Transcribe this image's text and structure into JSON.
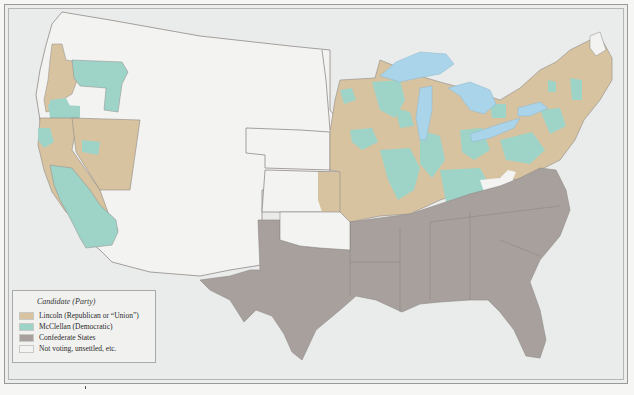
{
  "map": {
    "colors": {
      "lincoln": "#d8c3a0",
      "mcclellan": "#9ed3c8",
      "confederate": "#a8a09c",
      "not_voting": "#f3f3f1",
      "water": "#a9d4ea",
      "background": "#e9ecea",
      "border": "#8f8a88"
    },
    "regions": [
      "Pacific states (Oregon, California) - Lincoln/McClellan counties",
      "Nevada - Lincoln",
      "Western territories - Not voting",
      "Nebraska / Dakota / Colorado territories - Not voting",
      "Kansas - Lincoln",
      "Midwest (Minnesota, Iowa, Missouri, Illinois, Indiana, Ohio, Michigan, Wisconsin) - mixed Lincoln/McClellan",
      "Northeast (New York, Pennsylvania, New England) - mixed Lincoln/McClellan",
      "Kentucky - mostly McClellan",
      "Confederate States (Texas through Virginia, Florida)"
    ]
  },
  "legend": {
    "title": "Candidate (Party)",
    "items": [
      {
        "label": "Lincoln (Republican or “Union”)",
        "color": "#d8c3a0"
      },
      {
        "label": "McClellan (Democratic)",
        "color": "#9ed3c8"
      },
      {
        "label": "Confederate States",
        "color": "#a8a09c"
      },
      {
        "label": "Not voting, unsettled, etc.",
        "color": "#f3f3f1"
      }
    ]
  }
}
